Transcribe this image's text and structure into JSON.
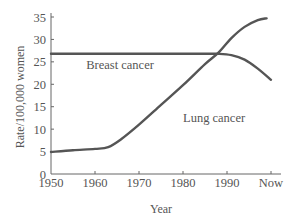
{
  "chart_data": {
    "type": "line",
    "title": "",
    "xlabel": "Year",
    "ylabel": "Rate/100,000 women",
    "x_tick_labels": [
      "1950",
      "1960",
      "1970",
      "1980",
      "1990",
      "Now"
    ],
    "y_tick_labels": [
      "0",
      "5",
      "10",
      "15",
      "20",
      "25",
      "30",
      "35"
    ],
    "xlim": [
      1950,
      2000
    ],
    "ylim": [
      0,
      35
    ],
    "grid": false,
    "legend": "none (direct labels)",
    "series": [
      {
        "name": "Breast cancer",
        "color": "#555555",
        "x": [
          1950,
          1960,
          1970,
          1980,
          1985,
          1988,
          1991,
          1994,
          1997,
          2000
        ],
        "values": [
          26.8,
          26.8,
          26.8,
          26.8,
          26.8,
          26.8,
          26.5,
          25.5,
          23.5,
          21.0
        ]
      },
      {
        "name": "Lung cancer",
        "color": "#555555",
        "x": [
          1950,
          1955,
          1960,
          1963,
          1966,
          1970,
          1975,
          1980,
          1985,
          1988,
          1991,
          1994,
          1997,
          1999
        ],
        "values": [
          4.9,
          5.3,
          5.6,
          6.0,
          7.8,
          11.0,
          15.4,
          19.8,
          24.5,
          27.0,
          30.3,
          32.8,
          34.3,
          34.7
        ]
      }
    ],
    "annotations": [
      {
        "text": "Breast cancer",
        "x": 1958,
        "y": 23.5
      },
      {
        "text": "Lung cancer",
        "x": 1980,
        "y": 11.5
      }
    ]
  }
}
